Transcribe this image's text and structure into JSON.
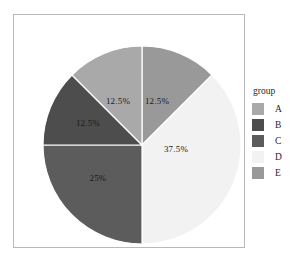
{
  "chart_data": {
    "type": "pie",
    "title": "",
    "legend_title": "group",
    "legend_position": "right",
    "categories": [
      "A",
      "B",
      "C",
      "D",
      "E"
    ],
    "values": [
      12.5,
      12.5,
      25,
      37.5,
      12.5
    ],
    "labels": [
      "12.5%",
      "12.5%",
      "25%",
      "37.5%",
      "12.5%"
    ],
    "colors": [
      "#a9a9a9",
      "#4d4d4d",
      "#5c5c5c",
      "#f2f2f2",
      "#999999"
    ],
    "slices": [
      {
        "category": "E",
        "label": "12.5%",
        "value": 12.5,
        "color": "#999999",
        "start_deg": 0,
        "end_deg": 45,
        "label_x": 143,
        "label_y": 86
      },
      {
        "category": "D",
        "label": "37.5%",
        "value": 37.5,
        "color": "#f2f2f2",
        "start_deg": 45,
        "end_deg": 180,
        "label_x": 162,
        "label_y": 134
      },
      {
        "category": "C",
        "label": "25%",
        "value": 25,
        "color": "#5c5c5c",
        "start_deg": 180,
        "end_deg": 270,
        "label_x": 84,
        "label_y": 163
      },
      {
        "category": "B",
        "label": "12.5%",
        "value": 12.5,
        "color": "#4d4d4d",
        "start_deg": 270,
        "end_deg": 315,
        "label_x": 74,
        "label_y": 108
      },
      {
        "category": "A",
        "label": "12.5%",
        "value": 12.5,
        "color": "#a9a9a9",
        "start_deg": 315,
        "end_deg": 360,
        "label_x": 104,
        "label_y": 86
      }
    ],
    "geometry": {
      "center_x": 128,
      "center_y": 130,
      "radius": 99,
      "slice_border_color": "#ffffff"
    }
  },
  "legend": {
    "title": "group",
    "entries": [
      {
        "label": "A",
        "color": "#a9a9a9"
      },
      {
        "label": "B",
        "color": "#4d4d4d"
      },
      {
        "label": "C",
        "color": "#5c5c5c"
      },
      {
        "label": "D",
        "color": "#f2f2f2"
      },
      {
        "label": "E",
        "color": "#999999"
      }
    ]
  },
  "panel": {
    "background": "#ffffff",
    "border_color": "#b9b9b9"
  }
}
